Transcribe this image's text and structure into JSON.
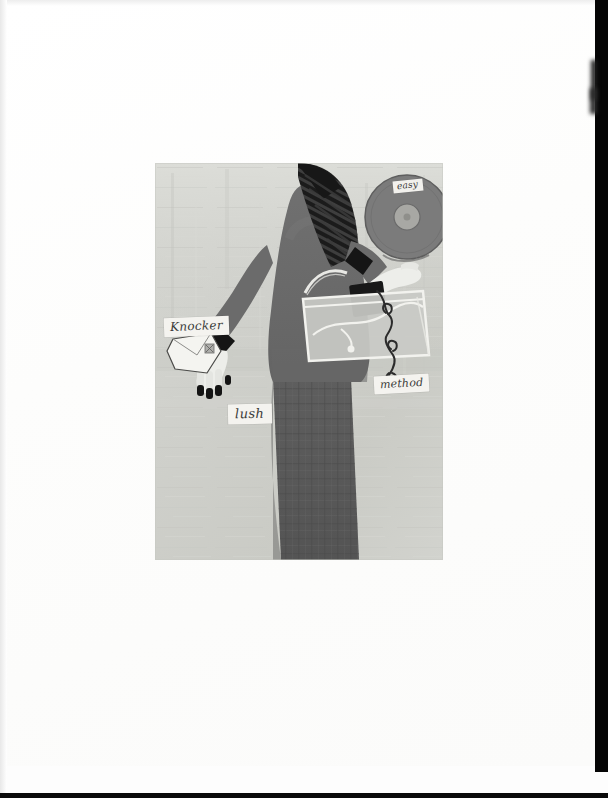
{
  "page": {
    "medium": "scanned printed page",
    "background_color": "#fdfdfd",
    "scan_edge_color": "#050505"
  },
  "artwork": {
    "title": "Stylized woman with disc, envelope and translucent handbag",
    "plate_background_color": "#cfd0cb",
    "palette": {
      "background_wash": "#cfd0cb",
      "background_wash_light": "#d8d9d4",
      "figure_top": "#6b6b6b",
      "figure_skirt": "#5a5a5a",
      "hair_dark": "#1e1e1e",
      "cuff_dark": "#161616",
      "skin_light": "#eeeeea",
      "disc_gray": "#7b7b7b",
      "bag_translucent": "#c9cac5",
      "outline_white": "#f2f2ee",
      "cord_dark": "#2a2a2a"
    },
    "elements": [
      {
        "name": "background-wash",
        "kind": "painted texture panel"
      },
      {
        "name": "figure-body",
        "kind": "woman in gray top and long skirt"
      },
      {
        "name": "figure-hair",
        "kind": "dark striped bob hair"
      },
      {
        "name": "figure-skirt",
        "kind": "dark gray plaid skirt"
      },
      {
        "name": "raised-arm",
        "kind": "arm lifted holding disc"
      },
      {
        "name": "lowered-arm",
        "kind": "arm lowered holding envelope"
      },
      {
        "name": "disc",
        "kind": "gray vinyl record / disc with center hole"
      },
      {
        "name": "envelope",
        "kind": "white pentagon envelope with seal"
      },
      {
        "name": "handbag",
        "kind": "translucent rectangular handbag"
      },
      {
        "name": "cord",
        "kind": "dark curly cord trailing from bag"
      },
      {
        "name": "dark-block",
        "kind": "small black box near bag strap"
      }
    ]
  },
  "annotations": [
    {
      "id": "knocker",
      "text": "Knocker",
      "note": "handwritten cursive label on small white slip"
    },
    {
      "id": "lush",
      "text": "lush",
      "note": "handwritten cursive label on small white slip"
    },
    {
      "id": "method",
      "text": "method",
      "note": "handwritten cursive label on small white slip"
    },
    {
      "id": "disc_label",
      "text": "easy",
      "note": "handwritten cursive label on disc sticker"
    }
  ]
}
